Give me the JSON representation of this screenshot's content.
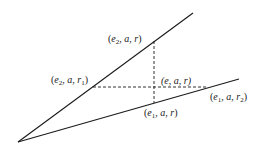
{
  "diagram": {
    "lines": [
      {
        "name": "upper-ray",
        "style": "solid",
        "description": "ray through (e2, a, r1) and (e2, a, r)"
      },
      {
        "name": "lower-ray",
        "style": "solid",
        "description": "ray through (e1, a, r) and (e1, a, r2)"
      },
      {
        "name": "horizontal-dashed",
        "style": "dashed",
        "description": "from (e2, a, r1) to (e1, a, r2)"
      },
      {
        "name": "vertical-dashed",
        "style": "dashed",
        "description": "from (e2, a, r) to (e1, a, r)"
      }
    ],
    "labels": {
      "top": {
        "open": "(",
        "e": "e",
        "sub": "2",
        "rest": ", a, r",
        "close": ")"
      },
      "left": {
        "open": "(",
        "e": "e",
        "sub": "2",
        "mid": ", a, r",
        "rsub": "1",
        "close": ")"
      },
      "center": {
        "text": "(e, a, r)"
      },
      "right": {
        "open": "(",
        "e": "e",
        "sub": "1",
        "mid": ", a, r",
        "rsub": "2",
        "close": ")"
      },
      "bottom": {
        "open": "(",
        "e": "e",
        "sub": "1",
        "rest": ", a, r",
        "close": ")"
      }
    },
    "colors": {
      "stroke": "#1a1a1a",
      "background": "#ffffff"
    }
  }
}
